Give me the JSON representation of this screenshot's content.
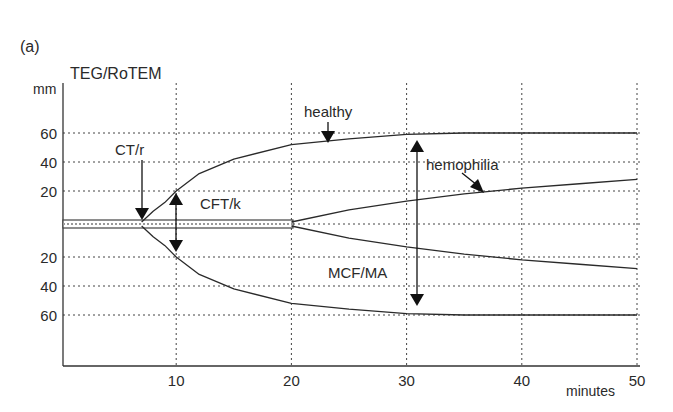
{
  "panel_label": "(a)",
  "chart_data": {
    "type": "line",
    "title": "TEG/RoTEM",
    "xlabel": "minutes",
    "ylabel": "mm",
    "xlim": [
      0,
      50
    ],
    "x_ticks": [
      10,
      20,
      30,
      40,
      50
    ],
    "y_ticks_upper": [
      60,
      40,
      20
    ],
    "y_ticks_lower": [
      20,
      40,
      60
    ],
    "grid": true,
    "legend": null,
    "note": "Amplitude is mirrored above and below a baseline (symmetric TEG trace).",
    "series": [
      {
        "name": "healthy",
        "x": [
          0,
          7,
          8,
          9,
          10,
          12,
          15,
          20,
          25,
          30,
          35,
          40,
          50
        ],
        "y": [
          0,
          0,
          6,
          12,
          20,
          32,
          42,
          52,
          56,
          59,
          60,
          60,
          60
        ]
      },
      {
        "name": "hemophilia",
        "x": [
          0,
          20,
          25,
          30,
          35,
          40,
          45,
          50
        ],
        "y": [
          0,
          0,
          7,
          13,
          18,
          22,
          25,
          28
        ]
      }
    ],
    "annotations": [
      {
        "text": "CT/r",
        "x": 7,
        "description": "arrow pointing down to clot onset on baseline"
      },
      {
        "text": "CFT/k",
        "x": 10,
        "description": "double arrow from baseline to 20 mm"
      },
      {
        "text": "healthy",
        "description": "arrow to upper healthy trace"
      },
      {
        "text": "hemophilia",
        "description": "arrow to upper hemophilia trace"
      },
      {
        "text": "MCF/MA",
        "x": 31,
        "description": "double arrow spanning maximum amplitude, 60 to 60"
      }
    ]
  }
}
